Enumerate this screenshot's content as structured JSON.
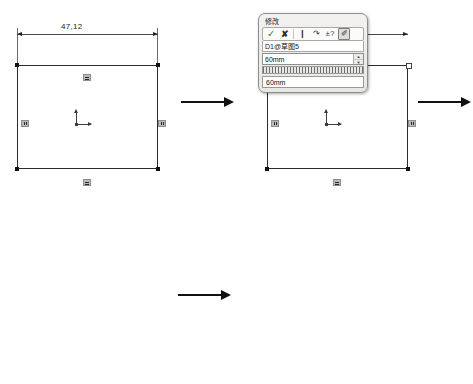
{
  "figure": {
    "steps": 4
  },
  "panels": [
    {
      "id": "step1",
      "name": "initial-sketch",
      "dimension_top": "47,12",
      "constraints": [
        "horizontal",
        "horizontal",
        "vertical",
        "vertical"
      ]
    },
    {
      "id": "step2",
      "name": "modify-dialog-open",
      "dialog": {
        "title": "修改",
        "variable": "D1@草图5",
        "value": "60mm",
        "echo_value": "60mm",
        "spin_up": "▲",
        "spin_down": "▼",
        "toolbar": [
          {
            "name": "confirm-icon",
            "glyph": "✓"
          },
          {
            "name": "cancel-icon",
            "glyph": "✘"
          },
          {
            "name": "rebuild-icon",
            "glyph": "❙"
          },
          {
            "name": "undo-icon",
            "glyph": "↷"
          },
          {
            "name": "tolerance-icon",
            "glyph": "±?"
          },
          {
            "name": "mark-for-drawing-icon",
            "glyph": "✐"
          }
        ]
      }
    },
    {
      "id": "step3",
      "name": "sketch-after-width",
      "dimension_top": "60"
    },
    {
      "id": "step4",
      "name": "sketch-fully-dimensioned",
      "dimension_top": "60",
      "dimension_right": "56"
    }
  ],
  "flow_arrows": [
    {
      "name": "arrow-step1-to-step2"
    },
    {
      "name": "arrow-step2-to-step3"
    },
    {
      "name": "arrow-step3-to-step4"
    }
  ],
  "colors": {
    "sketch_line": "#3a3a3a",
    "dimension": "#222222",
    "dialog_bg": "#f2f1ee",
    "text": "#1a1a1a"
  }
}
